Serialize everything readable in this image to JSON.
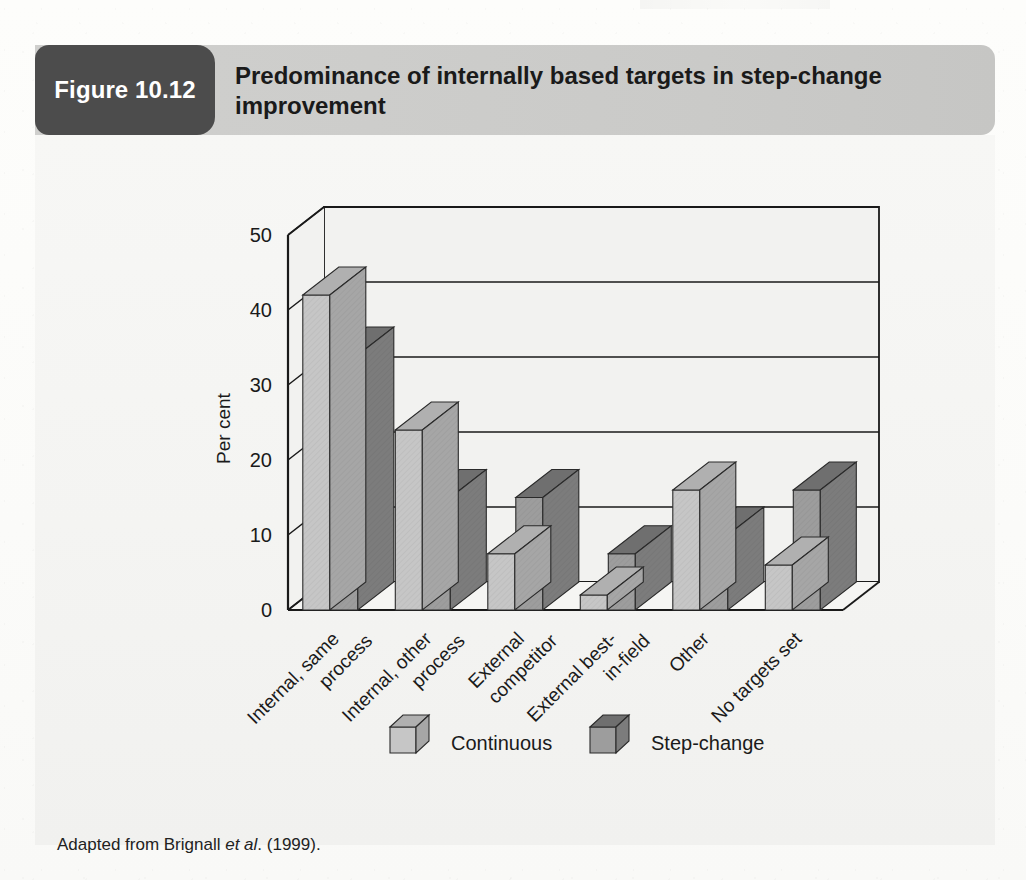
{
  "header": {
    "badge_label": "Figure 10.12",
    "title": "Predominance of internally based targets in step-change improvement"
  },
  "caption": {
    "prefix": "Adapted from Brignall ",
    "italic": "et al",
    "suffix": ". (1999)."
  },
  "colors": {
    "badge_bg": "#4c4c4c",
    "header_band": "#cdcdcb",
    "panel_bg": "#f4f4f2",
    "continuous_front": "#c6c6c6",
    "continuous_top": "#b0b0b0",
    "continuous_side": "#a6a6a6",
    "stepchange_front": "#9d9d9d",
    "stepchange_top": "#6f6f6f",
    "stepchange_side": "#7c7c7c",
    "axis": "#1a1a1a"
  },
  "chart_data": {
    "type": "bar",
    "title": "Predominance of internally based targets in step-change improvement",
    "xlabel": "",
    "ylabel": "Per cent",
    "ylim": [
      0,
      50
    ],
    "yticks": [
      0,
      10,
      20,
      30,
      40,
      50
    ],
    "ytick_labels": [
      "0",
      "10",
      "20",
      "30",
      "40",
      "50"
    ],
    "grid": true,
    "legend_position": "bottom",
    "style": "3d-clustered-column",
    "categories": [
      "Internal, same process",
      "Internal, other process",
      "External competitor",
      "External best-in-field",
      "Other",
      "No targets set"
    ],
    "category_lines": [
      [
        "Internal, same",
        "process"
      ],
      [
        "Internal, other",
        "process"
      ],
      [
        "External",
        "competitor"
      ],
      [
        "External best-",
        "in-field"
      ],
      [
        "Other"
      ],
      [
        "No targets set"
      ]
    ],
    "series": [
      {
        "name": "Continuous",
        "values": [
          42,
          24,
          7.5,
          2,
          16,
          6
        ]
      },
      {
        "name": "Step-change",
        "values": [
          34,
          15,
          15,
          7.5,
          10,
          16
        ]
      }
    ]
  },
  "legend": {
    "items": [
      {
        "label": "Continuous"
      },
      {
        "label": "Step-change"
      }
    ]
  },
  "axis": {
    "y_title": "Per cent"
  }
}
